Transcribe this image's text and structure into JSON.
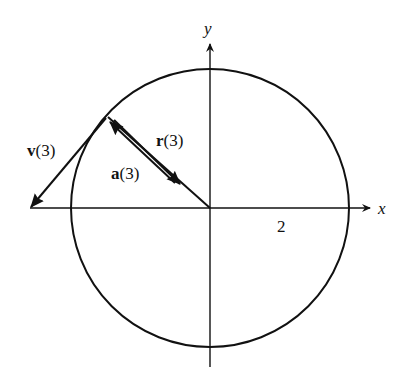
{
  "diagram": {
    "type": "circular-motion-vectors",
    "axes": {
      "x_label": "x",
      "y_label": "y",
      "tick_label": "2"
    },
    "circle": {
      "radius_label": "2"
    },
    "vectors": {
      "velocity": {
        "name": "v",
        "arg": "(3)"
      },
      "position": {
        "name": "r",
        "arg": "(3)"
      },
      "acceleration": {
        "name": "a",
        "arg": "(3)"
      }
    },
    "colors": {
      "stroke": "#111111",
      "background": "#ffffff"
    }
  }
}
